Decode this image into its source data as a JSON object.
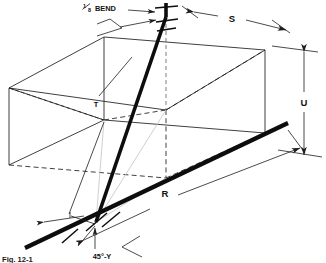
{
  "figure": {
    "type": "isometric-piping-diagram",
    "caption": "Fig. 12-1",
    "background_color": "#ffffff",
    "line_color": "#1d1d1d",
    "pipe_color": "#0d0d0d",
    "ghost_color": "#c9c9c9"
  },
  "labels": {
    "bend": {
      "fraction_numerator": "1",
      "fraction_denominator": "8",
      "text": "BEND",
      "full_text": "1/8 BEND"
    },
    "travel": "T",
    "set": "S",
    "rise": "U",
    "run": "R",
    "fitting_angle": "45°-Y"
  },
  "dimensions": [
    {
      "name": "S",
      "label": "S",
      "orientation": "top-oblique",
      "arrows": "both-ends"
    },
    {
      "name": "U",
      "label": "U",
      "orientation": "vertical",
      "arrows": "both-ends"
    },
    {
      "name": "R",
      "label": "R",
      "orientation": "bottom-oblique",
      "arrows": "both-ends"
    },
    {
      "name": "T",
      "label": "T",
      "orientation": "leader-to-diagonal-pipe",
      "arrows": "none"
    }
  ],
  "callouts": [
    {
      "name": "bend-callout",
      "label": "1/8 BEND",
      "points_to": "top-fitting"
    },
    {
      "name": "y-callout",
      "label": "45°-Y",
      "points_to": "bottom-fitting"
    }
  ],
  "fittings": [
    {
      "name": "top-fitting",
      "type": "1/8 bend",
      "x": 166,
      "y": 17
    },
    {
      "name": "bottom-fitting",
      "type": "45°-Y",
      "x": 96,
      "y": 222
    }
  ]
}
